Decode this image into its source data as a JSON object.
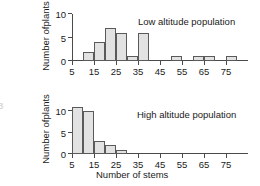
{
  "figure": {
    "edge_letter": "B",
    "xlabel": "Number of stems",
    "ylabel_line1": "Number of",
    "ylabel_line2": "plants"
  },
  "chart_data": [
    {
      "type": "bar",
      "title": "Low altitude population",
      "xlabel": "",
      "ylabel": "Number of plants",
      "bin_width": 5,
      "bin_starts": [
        5,
        10,
        15,
        20,
        25,
        30,
        35,
        40,
        45,
        50,
        55,
        60,
        65,
        70,
        75,
        80
      ],
      "values": [
        0,
        2,
        4,
        7,
        6,
        1,
        6,
        0,
        0,
        1,
        0,
        1,
        1,
        0,
        1,
        0
      ],
      "xticks": [
        5,
        15,
        25,
        35,
        45,
        55,
        65,
        75
      ],
      "xticklabels": [
        "5",
        "15",
        "25",
        "35",
        "45",
        "55",
        "65",
        "75"
      ],
      "yticks": [
        0,
        5,
        10
      ],
      "yticklabels": [
        "0",
        "5",
        "10"
      ],
      "xlim": [
        5,
        85
      ],
      "ylim": [
        0,
        10
      ],
      "grid": false,
      "legend": "none"
    },
    {
      "type": "bar",
      "title": "High altitude population",
      "xlabel": "Number of stems",
      "ylabel": "Number of plants",
      "bin_width": 5,
      "bin_starts": [
        5,
        10,
        15,
        20,
        25,
        30,
        35,
        40,
        45,
        50,
        55,
        60,
        65,
        70,
        75,
        80
      ],
      "values": [
        11,
        10,
        3,
        2,
        1,
        0,
        0,
        0,
        0,
        0,
        0,
        0,
        0,
        0,
        0,
        0
      ],
      "xticks": [
        5,
        15,
        25,
        35,
        45,
        55,
        65,
        75
      ],
      "xticklabels": [
        "5",
        "15",
        "25",
        "35",
        "45",
        "55",
        "65",
        "75"
      ],
      "yticks": [
        0,
        5,
        10
      ],
      "yticklabels": [
        "0",
        "5",
        "10"
      ],
      "xlim": [
        5,
        85
      ],
      "ylim": [
        0,
        11
      ],
      "grid": false,
      "legend": "none"
    }
  ],
  "colors": {
    "bar_fill": "#e2e2e2",
    "bar_edge": "#5a5a5a",
    "axis": "#4a4a4a",
    "text": "#1a1a1a"
  }
}
